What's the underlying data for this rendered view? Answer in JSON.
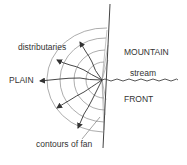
{
  "diagram": {
    "labels": {
      "distributaries": "distributaries",
      "plain": "PLAIN",
      "mountain": "MOUNTAIN",
      "stream": "stream",
      "front": "FRONT",
      "contours": "contours of fan"
    },
    "colors": {
      "line": "#444444",
      "contour": "#888888",
      "text": "#333333",
      "background": "#ffffff"
    }
  }
}
